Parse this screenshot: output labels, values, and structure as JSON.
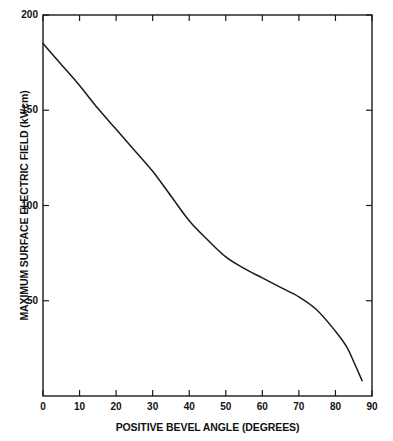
{
  "chart_data": {
    "type": "line",
    "title": "",
    "xlabel": "POSITIVE BEVEL ANGLE (DEGREES)",
    "ylabel": "MAXIMUM SURFACE ELECTRIC FIELD (kV/cm)",
    "xlim": [
      0,
      90
    ],
    "ylim": [
      0,
      200
    ],
    "xticks": [
      0,
      10,
      20,
      30,
      40,
      50,
      60,
      70,
      80,
      90
    ],
    "xtick_labels": [
      "0",
      "10",
      "20",
      "30",
      "40",
      "50",
      "60",
      "70",
      "80",
      "90"
    ],
    "yticks": [
      50,
      100,
      150,
      200
    ],
    "ytick_labels": [
      "50",
      "100",
      "150",
      "200"
    ],
    "grid": false,
    "legend": null,
    "frame": "box",
    "tick_direction": "in",
    "line_color": "#1a1a1a",
    "series": [
      {
        "name": "maximum surface electric field",
        "x": [
          0,
          5,
          10,
          15,
          20,
          25,
          30,
          35,
          40,
          45,
          50,
          55,
          60,
          65,
          70,
          75,
          80,
          83,
          85,
          87.3
        ],
        "y": [
          185,
          174,
          163,
          151,
          140,
          129,
          118,
          105,
          92,
          82,
          73,
          67,
          62,
          57,
          52,
          45,
          34,
          26,
          18,
          8
        ]
      }
    ]
  }
}
